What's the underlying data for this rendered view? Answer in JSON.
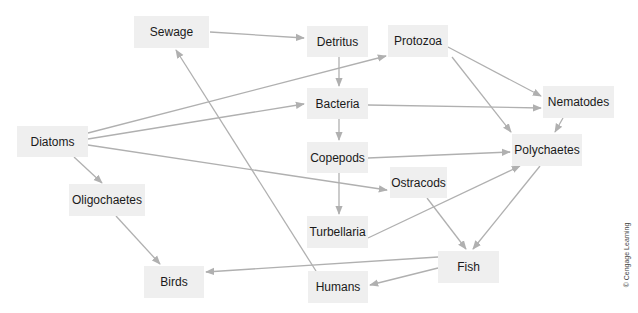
{
  "diagram": {
    "type": "food-web",
    "colors": {
      "node_fill": "#efefef",
      "edge": "#b0b0b0",
      "text": "#1a1a1a"
    },
    "nodes": [
      {
        "id": "sewage",
        "label": "Sewage",
        "x": 134,
        "y": 16,
        "w": 75,
        "h": 32
      },
      {
        "id": "detritus",
        "label": "Detritus",
        "x": 307,
        "y": 26,
        "w": 61,
        "h": 31
      },
      {
        "id": "protozoa",
        "label": "Protozoa",
        "x": 388,
        "y": 25,
        "w": 60,
        "h": 32
      },
      {
        "id": "bacteria",
        "label": "Bacteria",
        "x": 307,
        "y": 88,
        "w": 61,
        "h": 31
      },
      {
        "id": "nematodes",
        "label": "Nematodes",
        "x": 543,
        "y": 86,
        "w": 71,
        "h": 32
      },
      {
        "id": "diatoms",
        "label": "Diatoms",
        "x": 17,
        "y": 126,
        "w": 71,
        "h": 31
      },
      {
        "id": "polychaetes",
        "label": "Polychaetes",
        "x": 512,
        "y": 134,
        "w": 70,
        "h": 32
      },
      {
        "id": "copepods",
        "label": "Copepods",
        "x": 307,
        "y": 142,
        "w": 61,
        "h": 31
      },
      {
        "id": "ostracods",
        "label": "Ostracods",
        "x": 390,
        "y": 167,
        "w": 57,
        "h": 31
      },
      {
        "id": "oligochaetes",
        "label": "Oligochaetes",
        "x": 69,
        "y": 184,
        "w": 76,
        "h": 32
      },
      {
        "id": "turbellaria",
        "label": "Turbellaria",
        "x": 307,
        "y": 216,
        "w": 61,
        "h": 32
      },
      {
        "id": "fish",
        "label": "Fish",
        "x": 438,
        "y": 251,
        "w": 61,
        "h": 32
      },
      {
        "id": "birds",
        "label": "Birds",
        "x": 144,
        "y": 266,
        "w": 60,
        "h": 32
      },
      {
        "id": "humans",
        "label": "Humans",
        "x": 308,
        "y": 271,
        "w": 60,
        "h": 32
      }
    ],
    "edges": [
      {
        "from": "sewage",
        "to": "detritus",
        "x1": 210,
        "y1": 32,
        "x2": 304,
        "y2": 38
      },
      {
        "from": "diatoms",
        "to": "protozoa",
        "x1": 88,
        "y1": 133,
        "x2": 386,
        "y2": 56
      },
      {
        "from": "diatoms",
        "to": "bacteria",
        "x1": 88,
        "y1": 139,
        "x2": 304,
        "y2": 104
      },
      {
        "from": "diatoms",
        "to": "ostracods",
        "x1": 88,
        "y1": 145,
        "x2": 387,
        "y2": 190
      },
      {
        "from": "diatoms",
        "to": "oligochaetes",
        "x1": 74,
        "y1": 157,
        "x2": 102,
        "y2": 183
      },
      {
        "from": "detritus",
        "to": "bacteria",
        "x1": 339,
        "y1": 57,
        "x2": 339,
        "y2": 86
      },
      {
        "from": "bacteria",
        "to": "nematodes",
        "x1": 368,
        "y1": 105,
        "x2": 541,
        "y2": 108
      },
      {
        "from": "bacteria",
        "to": "copepods",
        "x1": 339,
        "y1": 119,
        "x2": 339,
        "y2": 140
      },
      {
        "from": "protozoa",
        "to": "nematodes",
        "x1": 448,
        "y1": 47,
        "x2": 541,
        "y2": 96
      },
      {
        "from": "protozoa",
        "to": "polychaetes",
        "x1": 452,
        "y1": 57,
        "x2": 511,
        "y2": 132
      },
      {
        "from": "nematodes",
        "to": "polychaetes",
        "x1": 563,
        "y1": 118,
        "x2": 555,
        "y2": 132
      },
      {
        "from": "copepods",
        "to": "polychaetes",
        "x1": 368,
        "y1": 158,
        "x2": 510,
        "y2": 152
      },
      {
        "from": "copepods",
        "to": "turbellaria",
        "x1": 339,
        "y1": 173,
        "x2": 339,
        "y2": 214
      },
      {
        "from": "turbellaria",
        "to": "polychaetes",
        "x1": 368,
        "y1": 238,
        "x2": 520,
        "y2": 166
      },
      {
        "from": "ostracods",
        "to": "fish",
        "x1": 427,
        "y1": 198,
        "x2": 466,
        "y2": 249
      },
      {
        "from": "polychaetes",
        "to": "fish",
        "x1": 540,
        "y1": 166,
        "x2": 473,
        "y2": 249
      },
      {
        "from": "oligochaetes",
        "to": "birds",
        "x1": 116,
        "y1": 216,
        "x2": 160,
        "y2": 264
      },
      {
        "from": "fish",
        "to": "birds",
        "x1": 438,
        "y1": 257,
        "x2": 206,
        "y2": 272
      },
      {
        "from": "fish",
        "to": "humans",
        "x1": 438,
        "y1": 268,
        "x2": 370,
        "y2": 285
      },
      {
        "from": "humans",
        "to": "sewage",
        "x1": 316,
        "y1": 271,
        "x2": 176,
        "y2": 50
      }
    ]
  },
  "credit": "© Cengage Learning"
}
